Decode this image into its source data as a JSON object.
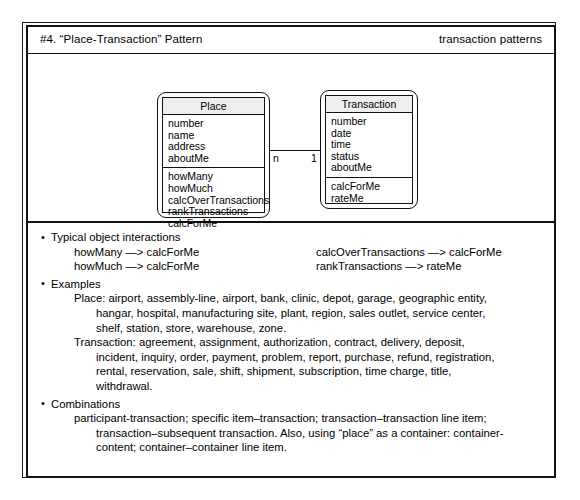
{
  "header": {
    "title": "#4. “Place-Transaction” Pattern",
    "category": "transaction patterns"
  },
  "diagram": {
    "classes": [
      {
        "name": "Place",
        "attributes": [
          "number",
          "name",
          "address",
          "aboutMe"
        ],
        "operations": [
          "howMany",
          "howMuch",
          "calcOverTransactions",
          "rankTransactions",
          "calcForMe"
        ]
      },
      {
        "name": "Transaction",
        "attributes": [
          "number",
          "date",
          "time",
          "status",
          "aboutMe"
        ],
        "operations": [
          "calcForMe",
          "rateMe"
        ]
      }
    ],
    "association": {
      "source_multiplicity": "n",
      "target_multiplicity": "1"
    }
  },
  "sections": {
    "interactions": {
      "heading": "Typical object interactions",
      "rows": [
        {
          "left": "howMany —> calcForMe",
          "right": "calcOverTransactions —> calcForMe"
        },
        {
          "left": "howMuch —> calcForMe",
          "right": "rankTransactions —> rateMe"
        }
      ]
    },
    "examples": {
      "heading": "Examples",
      "place_lines": [
        "Place: airport, assembly-line, airport, bank, clinic, depot, garage, geographic entity,",
        "hangar, hospital, manufacturing site, plant, region, sales outlet, service center,",
        "shelf, station, store, warehouse, zone."
      ],
      "transaction_lines": [
        "Transaction: agreement, assignment, authorization, contract, delivery, deposit,",
        "incident, inquiry, order, payment, problem, report, purchase, refund, registration,",
        "rental, reservation, sale, shift, shipment, subscription, time charge, title,",
        "withdrawal."
      ]
    },
    "combinations": {
      "heading": "Combinations",
      "lines": [
        "participant-transaction; specific item–transaction; transaction–transaction line item;",
        "transaction–subsequent transaction. Also, using “place” as a container: container-",
        "content; container–container line item."
      ]
    }
  },
  "bullet_glyph": "•"
}
